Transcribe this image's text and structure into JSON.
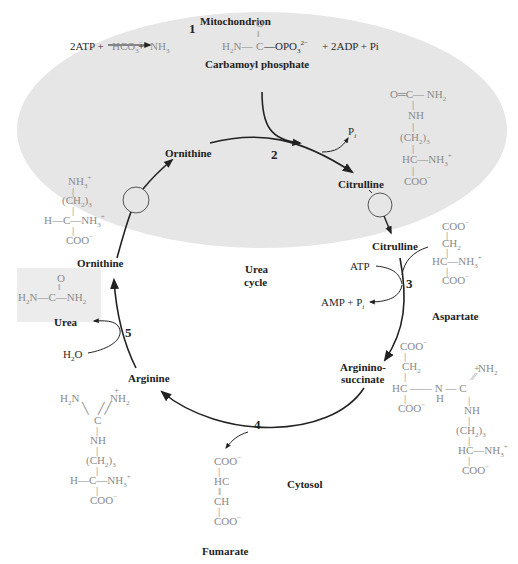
{
  "compartments": {
    "mitochondrion": "Mitochondrion",
    "cytosol": "Cytosol",
    "center_title_1": "Urea",
    "center_title_2": "cycle"
  },
  "reaction1": {
    "step": "1",
    "reactants": [
      "2ATP",
      "HCO3−",
      "NH3"
    ],
    "product_formula": "H2N—C(=O)—OPO3 2−",
    "byproducts": "+ 2ADP + Pi",
    "product_name": "Carbamoyl phosphate"
  },
  "steps": {
    "s2": "2",
    "s3": "3",
    "s4": "4",
    "s5": "5"
  },
  "labels": {
    "ornithine_mito": "Ornithine",
    "citrulline_mito": "Citrulline",
    "citrulline_cyto": "Citrulline",
    "ornithine_cyto": "Ornithine",
    "urea": "Urea",
    "aspartate": "Aspartate",
    "argininosuccinate_1": "Arginino-",
    "argininosuccinate_2": "succinate",
    "arginine": "Arginine",
    "fumarate": "Fumarate",
    "pi_step2": "Pi",
    "atp": "ATP",
    "amp_pi": "AMP + Pi",
    "h2o": "H2O"
  },
  "structures": {
    "citrulline": [
      "O=C—NH2",
      "NH",
      "(CH2)3",
      "HC—NH3+",
      "COO−"
    ],
    "ornithine": [
      "NH3+",
      "(CH2)3",
      "H—C—NH3+",
      "COO−"
    ],
    "urea": [
      "O",
      "H2N—C—NH2"
    ],
    "aspartate": [
      "COO−",
      "CH2",
      "HC—NH3+",
      "COO−"
    ],
    "argininosuccinate": [
      "COO−",
      "CH2",
      "HC—N(H)—C(=NH2+)",
      "COO−",
      "NH",
      "(CH2)3",
      "HC—NH3+",
      "COO−"
    ],
    "arginine": [
      "H2N",
      "NH2+",
      "C",
      "NH",
      "(CH2)3",
      "H—C—NH3+",
      "COO−"
    ],
    "fumarate": [
      "COO−",
      "HC",
      "CH",
      "COO−"
    ]
  },
  "colors": {
    "mitochondrion_fill": "#e6e6e6",
    "urea_box": "#ececec",
    "arrow": "#222222",
    "gray_text": "#8a8a8a"
  }
}
